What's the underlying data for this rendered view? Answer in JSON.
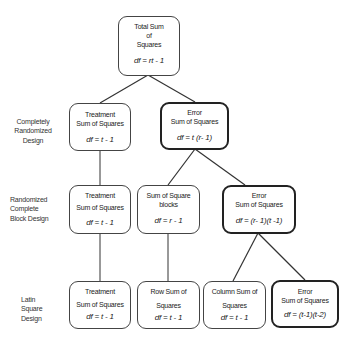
{
  "row_labels": {
    "crd": [
      "Completely",
      "Randomized",
      "Design"
    ],
    "rcbd": [
      "Randomized",
      "Complete",
      "Block Design"
    ],
    "lsd": [
      "Latin",
      "Square",
      "Design"
    ]
  },
  "nodes": {
    "total": {
      "lines": [
        "Total Sum",
        "of",
        "Squares"
      ],
      "df": "df = rt - 1"
    },
    "crd_treatment": {
      "lines": [
        "Treatment",
        "Sum of Squares"
      ],
      "df": "df = t - 1"
    },
    "crd_error": {
      "lines": [
        "Error",
        "Sum of Squares"
      ],
      "df": "df = t (r- 1)"
    },
    "rcbd_treatment": {
      "lines": [
        "Treatment",
        "Sum of Squares"
      ],
      "df": "df = t - 1"
    },
    "rcbd_blocks": {
      "lines": [
        "Sum of Square",
        "blocks"
      ],
      "df": "df = r - 1"
    },
    "rcbd_error": {
      "lines": [
        "Error",
        "Sum of Squares"
      ],
      "df": "df = (r- 1)(t -1)"
    },
    "lsd_treatment": {
      "lines": [
        "Treatment",
        "Sum of Squares"
      ],
      "df": "df = t - 1"
    },
    "lsd_row": {
      "lines": [
        "Row Sum of",
        "Squares"
      ],
      "df": "df = t - 1"
    },
    "lsd_column": {
      "lines": [
        "Column Sum of",
        "Squares"
      ],
      "df": "df = t - 1"
    },
    "lsd_error": {
      "lines": [
        "Error",
        "Sum of Squares"
      ],
      "df": "df = (t-1)(t-2)"
    }
  }
}
